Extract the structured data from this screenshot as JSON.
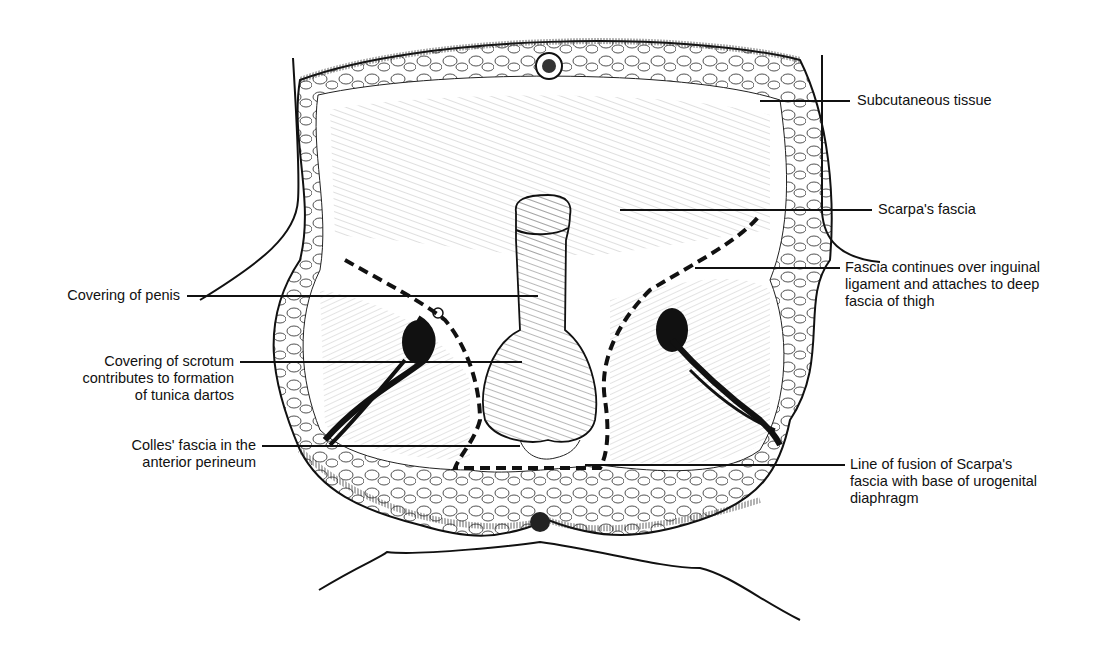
{
  "figure": {
    "colors": {
      "ink": "#111111",
      "background": "#ffffff",
      "dashed_line": "#111111"
    }
  },
  "labels": {
    "subcutaneous_tissue": {
      "lines": [
        "Subcutaneous tissue"
      ]
    },
    "scarpas_fascia": {
      "lines": [
        "Scarpa's fascia"
      ]
    },
    "fascia_continues": {
      "lines": [
        "Fascia continues over inguinal",
        "ligament and attaches to deep",
        "fascia of thigh"
      ]
    },
    "covering_of_penis": {
      "lines": [
        "Covering of penis"
      ]
    },
    "covering_of_scrotum": {
      "lines": [
        "Covering of scrotum",
        "contributes to formation",
        "of tunica dartos"
      ]
    },
    "colles_fascia": {
      "lines": [
        "Colles' fascia in the",
        "anterior perineum"
      ]
    },
    "line_of_fusion": {
      "lines": [
        "Line of fusion of Scarpa's",
        "fascia with base of urogenital",
        "diaphragm"
      ]
    }
  }
}
